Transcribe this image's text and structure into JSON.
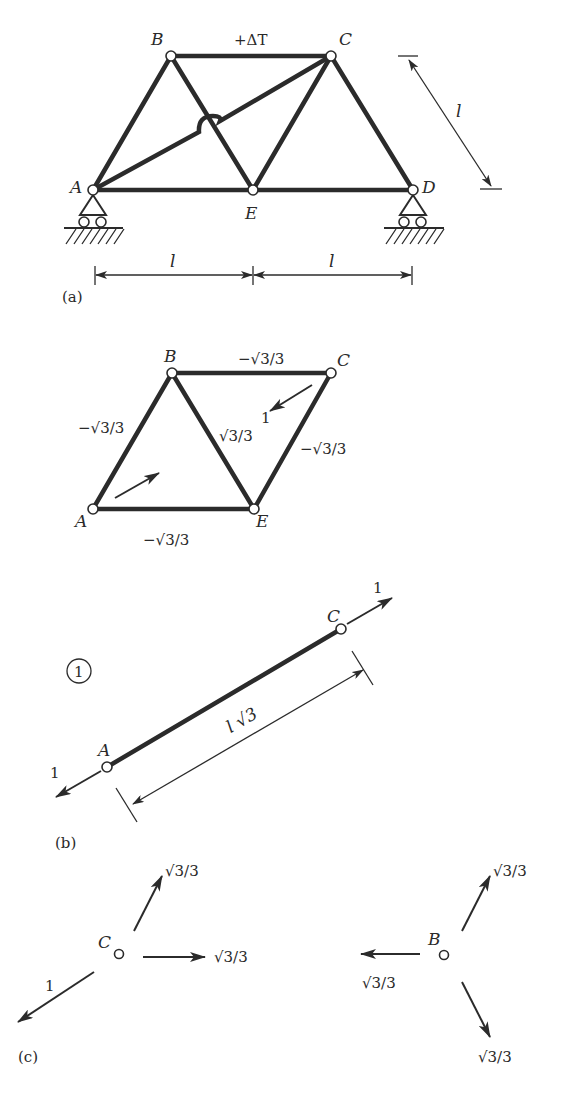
{
  "figure_a": {
    "caption": "(a)",
    "nodes": {
      "A": "A",
      "B": "B",
      "C": "C",
      "D": "D",
      "E": "E"
    },
    "temperature_label": "+ΔT",
    "dimension_side": "l",
    "dimension_span_left": "l",
    "dimension_span_right": "l"
  },
  "figure_b_truss": {
    "nodes": {
      "A": "A",
      "B": "B",
      "C": "C",
      "E": "E"
    },
    "member_forces": {
      "BC": "−√3/3",
      "AB": "−√3/3",
      "BE": "√3/3",
      "CE": "−√3/3",
      "AE": "−√3/3"
    },
    "unit_load": "1"
  },
  "figure_b_member": {
    "caption": "(b)",
    "member_id": "1",
    "nodes": {
      "A": "A",
      "C": "C"
    },
    "force_at_C": "1",
    "force_at_A": "1",
    "length_label": "l √3"
  },
  "figure_c": {
    "caption": "(c)",
    "node_C": {
      "label": "C",
      "force_up": "√3/3",
      "force_right": "√3/3",
      "force_down_left": "1"
    },
    "node_B": {
      "label": "B",
      "force_up": "√3/3",
      "force_left": "√3/3",
      "force_down": "√3/3"
    }
  }
}
